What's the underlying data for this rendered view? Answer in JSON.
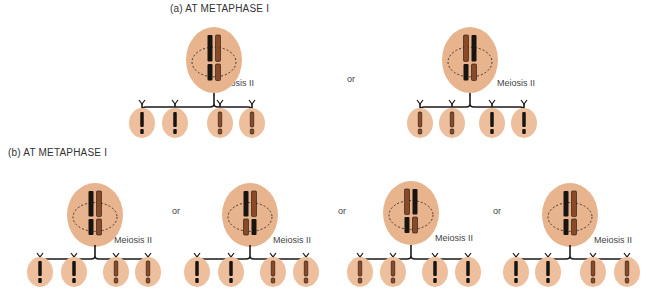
{
  "colors": {
    "cell_fill": "#e8b48e",
    "cell_fill_light": "#edbf9c",
    "chromosome_dark": "#1a1410",
    "chromosome_light": "#8a4a28",
    "line": "#1a1a1a"
  },
  "section_a": {
    "title": "(a) AT METAPHASE I",
    "or_label": "or",
    "scenarios": [
      {
        "meiosis_label": "Meiosis II",
        "cx": 214,
        "cy": 60,
        "daughters_x": [
          142,
          175,
          220,
          252
        ],
        "daughters_y": 123,
        "top_dark": "left",
        "bottom_dark": "left",
        "daughter_types": [
          "dark",
          "dark",
          "light",
          "light"
        ]
      },
      {
        "meiosis_label": "Meiosis II",
        "cx": 470,
        "cy": 60,
        "daughters_x": [
          420,
          452,
          492,
          524
        ],
        "daughters_y": 123,
        "top_dark": "right",
        "bottom_dark": "left",
        "daughter_types": [
          "light",
          "light",
          "dark",
          "dark"
        ]
      }
    ]
  },
  "section_b": {
    "title": "(b) AT METAPHASE I",
    "or_labels": [
      "or",
      "or",
      "or"
    ],
    "scenarios": [
      {
        "meiosis_label": "Meiosis II",
        "cx": 95,
        "cy": 215,
        "daughters_x": [
          40,
          74,
          116,
          148
        ],
        "daughters_y": 272,
        "daughter_types": [
          "dark",
          "dark",
          "light",
          "light"
        ]
      },
      {
        "meiosis_label": "Meiosis II",
        "cx": 250,
        "cy": 215,
        "daughters_x": [
          197,
          231,
          273,
          306
        ],
        "daughters_y": 272,
        "daughter_types": [
          "dark",
          "dark",
          "light",
          "light"
        ]
      },
      {
        "meiosis_label": "Meiosis II",
        "cx": 411,
        "cy": 213,
        "daughters_x": [
          360,
          393,
          435,
          468
        ],
        "daughters_y": 272,
        "daughter_types": [
          "light",
          "light",
          "dark",
          "dark"
        ]
      },
      {
        "meiosis_label": "Meiosis II",
        "cx": 570,
        "cy": 215,
        "daughters_x": [
          516,
          548,
          593,
          627
        ],
        "daughters_y": 272,
        "daughter_types": [
          "dark",
          "dark",
          "light",
          "light"
        ]
      }
    ]
  }
}
